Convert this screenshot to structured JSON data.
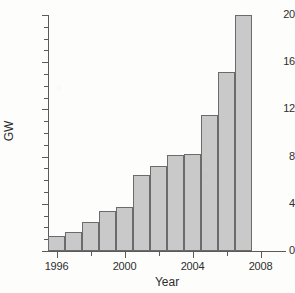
{
  "chart_data": {
    "type": "bar",
    "title": "",
    "xlabel": "Year",
    "ylabel": "GW",
    "categories": [
      1996,
      1997,
      1998,
      1999,
      2000,
      2001,
      2002,
      2003,
      2004,
      2005,
      2006,
      2007
    ],
    "values": [
      1.3,
      1.6,
      2.5,
      3.4,
      3.7,
      6.4,
      7.2,
      8.1,
      8.2,
      11.5,
      15.2,
      20.0
    ],
    "xlim": [
      1995.5,
      2009.5
    ],
    "ylim": [
      0,
      20
    ],
    "y_ticks_major": [
      0,
      4,
      8,
      12,
      16,
      20
    ],
    "y_tick_labels": [
      "0",
      "4",
      "8",
      "12",
      "16",
      "20"
    ],
    "y_ticks_minor": [
      1,
      2,
      3,
      5,
      6,
      7,
      9,
      10,
      11,
      13,
      14,
      15,
      17,
      18,
      19
    ],
    "x_ticks_major": [
      1996,
      2000,
      2004,
      2008
    ],
    "x_tick_labels": [
      "1996",
      "2000",
      "2004",
      "2008"
    ],
    "x_ticks_minor": [
      1998,
      2002,
      2006
    ],
    "grid": false,
    "legend": "none",
    "bar_fill_color": "#c9c9c9",
    "bar_edge_color": "#6b6b6b",
    "axis_color": "#5a5a5a",
    "background_color": "#fdfdfc",
    "text_color": "#2e2e2e"
  }
}
